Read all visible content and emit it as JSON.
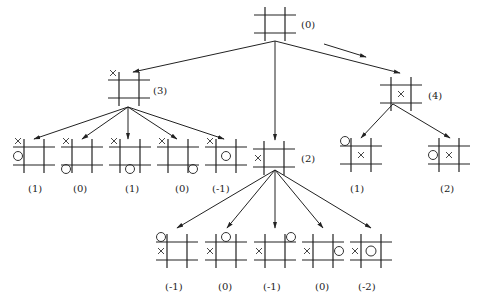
{
  "diagram": {
    "type": "game-tree",
    "root": {
      "id": "n0",
      "value": "(0)"
    },
    "nodes": [
      {
        "id": "n0",
        "label": "(0)",
        "level": 0,
        "x_marks": [],
        "o_marks": []
      },
      {
        "id": "n3",
        "label": "(3)",
        "level": 1,
        "x_marks": [
          "top-left-corner"
        ],
        "o_marks": []
      },
      {
        "id": "n2",
        "label": "(2)",
        "level": 2,
        "x_marks": [
          "left-edge"
        ],
        "o_marks": []
      },
      {
        "id": "n4",
        "label": "(4)",
        "level": 1,
        "x_marks": [
          "center"
        ],
        "o_marks": []
      },
      {
        "id": "a1",
        "label": "(1)",
        "level": 2,
        "x_marks": [
          "top-left-corner"
        ],
        "o_marks": [
          "left-edge"
        ]
      },
      {
        "id": "a2",
        "label": "(0)",
        "level": 2,
        "x_marks": [
          "top-left-corner"
        ],
        "o_marks": [
          "bottom-left-corner"
        ]
      },
      {
        "id": "a3",
        "label": "(1)",
        "level": 2,
        "x_marks": [
          "top-left-corner"
        ],
        "o_marks": [
          "bottom-edge"
        ]
      },
      {
        "id": "a4",
        "label": "(0)",
        "level": 2,
        "x_marks": [
          "top-left-corner"
        ],
        "o_marks": [
          "bottom-right-corner"
        ]
      },
      {
        "id": "a5",
        "label": "(-1)",
        "level": 2,
        "x_marks": [
          "top-left-corner"
        ],
        "o_marks": [
          "center"
        ]
      },
      {
        "id": "c1",
        "label": "(1)",
        "level": 2,
        "x_marks": [
          "center"
        ],
        "o_marks": [
          "top-left-corner"
        ]
      },
      {
        "id": "c2",
        "label": "(2)",
        "level": 2,
        "x_marks": [
          "center"
        ],
        "o_marks": [
          "left-edge"
        ]
      },
      {
        "id": "b1",
        "label": "(-1)",
        "level": 3,
        "x_marks": [
          "left-edge"
        ],
        "o_marks": [
          "top-left-corner"
        ]
      },
      {
        "id": "b2",
        "label": "(0)",
        "level": 3,
        "x_marks": [
          "left-edge"
        ],
        "o_marks": [
          "top-edge"
        ]
      },
      {
        "id": "b3",
        "label": "(-1)",
        "level": 3,
        "x_marks": [
          "left-edge"
        ],
        "o_marks": [
          "top-right-corner"
        ]
      },
      {
        "id": "b4",
        "label": "(0)",
        "level": 3,
        "x_marks": [
          "left-edge"
        ],
        "o_marks": [
          "right-edge"
        ]
      },
      {
        "id": "b5",
        "label": "(-2)",
        "level": 3,
        "x_marks": [
          "left-edge"
        ],
        "o_marks": [
          "center"
        ]
      }
    ],
    "edges": [
      {
        "from": "n0",
        "to": "n3"
      },
      {
        "from": "n0",
        "to": "n2"
      },
      {
        "from": "n0",
        "to": "n4",
        "highlighted": true
      },
      {
        "from": "n3",
        "to": "a1"
      },
      {
        "from": "n3",
        "to": "a2"
      },
      {
        "from": "n3",
        "to": "a3"
      },
      {
        "from": "n3",
        "to": "a4"
      },
      {
        "from": "n3",
        "to": "a5"
      },
      {
        "from": "n4",
        "to": "c1"
      },
      {
        "from": "n4",
        "to": "c2"
      },
      {
        "from": "n2",
        "to": "b1"
      },
      {
        "from": "n2",
        "to": "b2"
      },
      {
        "from": "n2",
        "to": "b3"
      },
      {
        "from": "n2",
        "to": "b4"
      },
      {
        "from": "n2",
        "to": "b5"
      }
    ],
    "labels": {
      "n0": "(0)",
      "n3": "(3)",
      "n4": "(4)",
      "n2": "(2)",
      "a1": "(1)",
      "a2": "(0)",
      "a3": "(1)",
      "a4": "(0)",
      "a5": "(-1)",
      "c1": "(1)",
      "c2": "(2)",
      "b1": "(-1)",
      "b2": "(0)",
      "b3": "(-1)",
      "b4": "(0)",
      "b5": "(-2)"
    },
    "colors": {
      "line": "#222222",
      "background": "#ffffff"
    }
  }
}
